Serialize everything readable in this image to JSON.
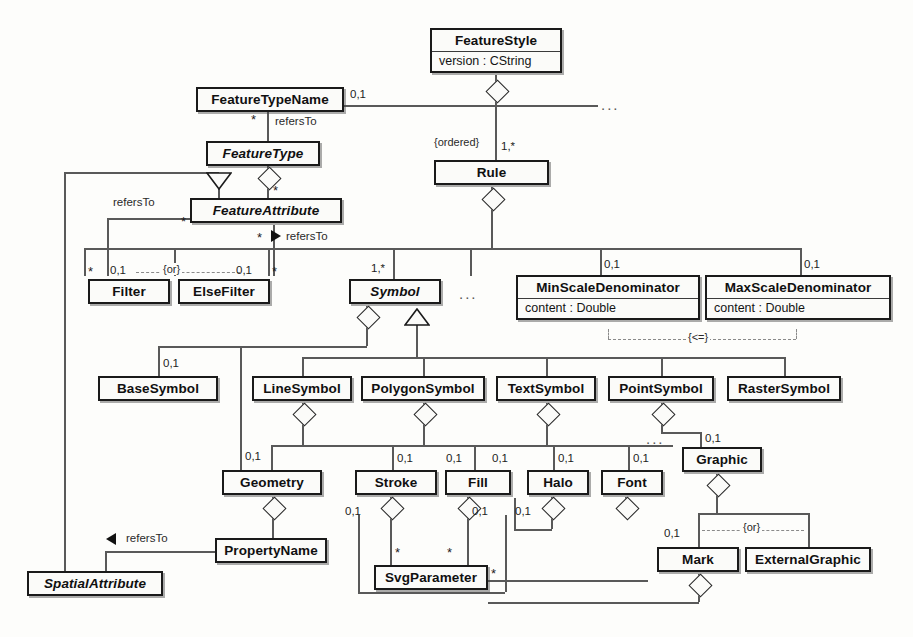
{
  "diagram": {
    "notation": "UML class diagram",
    "classes": [
      {
        "id": "featurestyle",
        "name": "FeatureStyle",
        "abstract": false,
        "attributes": [
          "version : CString"
        ]
      },
      {
        "id": "featuretypename",
        "name": "FeatureTypeName",
        "abstract": false,
        "attributes": []
      },
      {
        "id": "featuretype",
        "name": "FeatureType",
        "abstract": true,
        "attributes": []
      },
      {
        "id": "featureattribute",
        "name": "FeatureAttribute",
        "abstract": true,
        "attributes": []
      },
      {
        "id": "rule",
        "name": "Rule",
        "abstract": false,
        "attributes": []
      },
      {
        "id": "filter",
        "name": "Filter",
        "abstract": false,
        "attributes": []
      },
      {
        "id": "elsefilter",
        "name": "ElseFilter",
        "abstract": false,
        "attributes": []
      },
      {
        "id": "symbol",
        "name": "Symbol",
        "abstract": true,
        "attributes": []
      },
      {
        "id": "minscaledenominator",
        "name": "MinScaleDenominator",
        "abstract": false,
        "attributes": [
          "content : Double"
        ]
      },
      {
        "id": "maxscaledenominator",
        "name": "MaxScaleDenominator",
        "abstract": false,
        "attributes": [
          "content : Double"
        ]
      },
      {
        "id": "basesymbol",
        "name": "BaseSymbol",
        "abstract": false,
        "attributes": []
      },
      {
        "id": "linesymbol",
        "name": "LineSymbol",
        "abstract": false,
        "attributes": []
      },
      {
        "id": "polygonsymbol",
        "name": "PolygonSymbol",
        "abstract": false,
        "attributes": []
      },
      {
        "id": "textsymbol",
        "name": "TextSymbol",
        "abstract": false,
        "attributes": []
      },
      {
        "id": "pointsymbol",
        "name": "PointSymbol",
        "abstract": false,
        "attributes": []
      },
      {
        "id": "rastersymbol",
        "name": "RasterSymbol",
        "abstract": false,
        "attributes": []
      },
      {
        "id": "geometry",
        "name": "Geometry",
        "abstract": false,
        "attributes": []
      },
      {
        "id": "stroke",
        "name": "Stroke",
        "abstract": false,
        "attributes": []
      },
      {
        "id": "fill",
        "name": "Fill",
        "abstract": false,
        "attributes": []
      },
      {
        "id": "halo",
        "name": "Halo",
        "abstract": false,
        "attributes": []
      },
      {
        "id": "font",
        "name": "Font",
        "abstract": false,
        "attributes": []
      },
      {
        "id": "graphic",
        "name": "Graphic",
        "abstract": false,
        "attributes": []
      },
      {
        "id": "propertyname",
        "name": "PropertyName",
        "abstract": false,
        "attributes": []
      },
      {
        "id": "svgparameter",
        "name": "SvgParameter",
        "abstract": false,
        "attributes": []
      },
      {
        "id": "spatialattribute",
        "name": "SpatialAttribute",
        "abstract": true,
        "attributes": []
      },
      {
        "id": "mark",
        "name": "Mark",
        "abstract": false,
        "attributes": []
      },
      {
        "id": "externalgraphic",
        "name": "ExternalGraphic",
        "abstract": false,
        "attributes": []
      }
    ],
    "roles": {
      "refers_to_1": "refersTo",
      "refers_to_2": "refersTo",
      "refers_to_3": "refersTo",
      "refers_to_4": "refersTo"
    },
    "constraints": {
      "ordered": "{ordered}",
      "or_filter": "{or}",
      "or_graphic": "{or}",
      "scale_le": "{<=}"
    },
    "multiplicities": {
      "ftn_style": "0,1",
      "ftn_star": "*",
      "rule": "1,*",
      "fa_star_left": "*",
      "fa_star_refers": "*",
      "filter_left_star": "*",
      "filter": "0,1",
      "elsefilter": "0,1",
      "elsefilter_star": "*",
      "symbol": "1,*",
      "minscale": "0,1",
      "maxscale": "0,1",
      "basesymbol": "0,1",
      "geometry": "0,1",
      "stroke_left": "0,1",
      "stroke_right": "0,1",
      "fill_left": "0,1",
      "fill_right": "0,1",
      "halo": "0,1",
      "font": "0,1",
      "graphic": "0,1",
      "stroke_svg": "0,1",
      "fill_svg": "0,1",
      "halo_svg": "0,1",
      "svg_star_left": "*",
      "svg_star_right": "*",
      "svg_star_out": "*",
      "mark": "0,1"
    },
    "ellipses": {
      "top_right": "...",
      "symbol_row": "...",
      "graphic_row": "..."
    },
    "colors": {
      "line": "#595959",
      "box_border": "#1a1a1a",
      "text": "#101010",
      "dashed": "#8a8a8a",
      "background": "#fdfdfb"
    }
  }
}
